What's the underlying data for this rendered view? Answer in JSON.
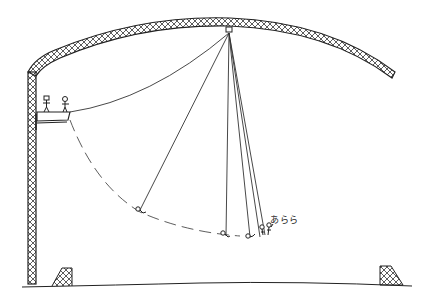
{
  "panel": {
    "style": "stick-figure line drawing",
    "colors": {
      "ink": "#222222",
      "background": "#ffffff",
      "truss_fill": "#ffffff"
    }
  },
  "structure": {
    "truss_arch": "lattice-truss-arch",
    "left_tower": "lattice-truss-column",
    "platform": "launch-platform",
    "pulley": "ceiling-pulley"
  },
  "figures": {
    "platform_people": 2,
    "swing_positions": 5
  },
  "speech": {
    "exclamation": "あらら"
  },
  "ground": {
    "goals": 2
  }
}
